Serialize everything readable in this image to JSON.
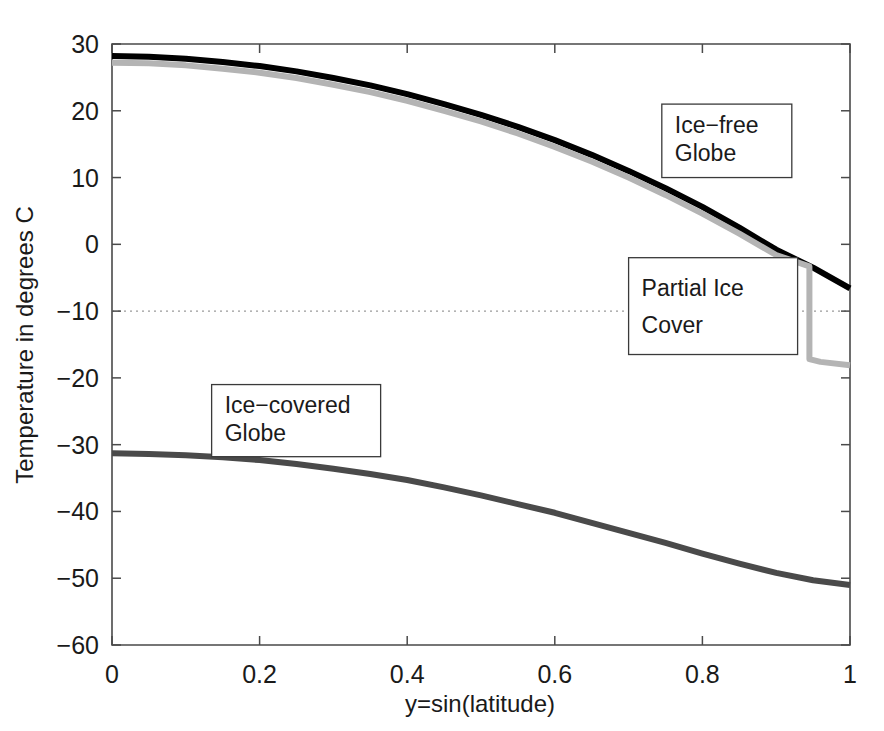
{
  "chart_data": {
    "type": "line",
    "title": "",
    "xlabel": "y=sin(latitude)",
    "ylabel": "Temperature in degrees C",
    "xlim": [
      0,
      1
    ],
    "ylim": [
      -60,
      30
    ],
    "xticks": [
      "0",
      "0.2",
      "0.4",
      "0.6",
      "0.8",
      "1"
    ],
    "xtick_values": [
      0,
      0.2,
      0.4,
      0.6,
      0.8,
      1
    ],
    "yticks": [
      "30",
      "20",
      "10",
      "0",
      "-10",
      "-20",
      "-30",
      "-40",
      "-50",
      "-60"
    ],
    "ytick_values": [
      30,
      20,
      10,
      0,
      -10,
      -20,
      -30,
      -40,
      -50,
      -60
    ],
    "grid": false,
    "legend_position": "none",
    "reference_lines": [
      {
        "name": "critical-temperature",
        "axis": "y",
        "value": -10,
        "style": "dotted",
        "color": "#9a9a9a"
      }
    ],
    "series": [
      {
        "name": "Ice-free Globe",
        "color": "#000000",
        "linewidth": 6,
        "x": [
          0,
          0.05,
          0.1,
          0.15,
          0.2,
          0.25,
          0.3,
          0.35,
          0.4,
          0.45,
          0.5,
          0.55,
          0.6,
          0.65,
          0.7,
          0.75,
          0.8,
          0.85,
          0.9,
          0.95,
          1.0
        ],
        "y": [
          28.2,
          28.1,
          27.8,
          27.3,
          26.7,
          25.9,
          24.9,
          23.8,
          22.5,
          21.0,
          19.4,
          17.6,
          15.6,
          13.4,
          11.0,
          8.4,
          5.6,
          2.5,
          -0.8,
          -3.5,
          -6.6
        ]
      },
      {
        "name": "Partial Ice Cover",
        "color": "#b4b4b4",
        "linewidth": 6,
        "x": [
          0,
          0.05,
          0.1,
          0.15,
          0.2,
          0.25,
          0.3,
          0.35,
          0.4,
          0.45,
          0.5,
          0.55,
          0.6,
          0.65,
          0.7,
          0.75,
          0.8,
          0.85,
          0.9,
          0.945,
          0.945,
          0.96,
          1.0
        ],
        "y": [
          27.2,
          27.1,
          26.8,
          26.3,
          25.7,
          24.9,
          23.9,
          22.8,
          21.5,
          20.0,
          18.4,
          16.6,
          14.6,
          12.4,
          10.0,
          7.4,
          4.6,
          1.6,
          -1.6,
          -3.3,
          -17.2,
          -17.6,
          -18.1
        ],
        "discontinuity_at_x": 0.945,
        "discontinuity_from_y": -3.3,
        "discontinuity_to_y": -17.2
      },
      {
        "name": "Ice-covered Globe",
        "color": "#4a4a4a",
        "linewidth": 6,
        "x": [
          0,
          0.05,
          0.1,
          0.15,
          0.2,
          0.25,
          0.3,
          0.35,
          0.4,
          0.45,
          0.5,
          0.55,
          0.6,
          0.65,
          0.7,
          0.75,
          0.8,
          0.85,
          0.9,
          0.95,
          1.0
        ],
        "y": [
          -31.3,
          -31.4,
          -31.6,
          -31.9,
          -32.3,
          -32.9,
          -33.6,
          -34.4,
          -35.3,
          -36.4,
          -37.6,
          -38.9,
          -40.2,
          -41.7,
          -43.2,
          -44.7,
          -46.3,
          -47.8,
          -49.2,
          -50.3,
          -51.0
        ]
      }
    ],
    "annotations": [
      {
        "name": "ice-free-globe",
        "line1": "Ice-free",
        "line2": "Globe",
        "box_x": 0.745,
        "box_y_top": 21.0,
        "box_y_bottom": 10.0
      },
      {
        "name": "partial-ice-cover",
        "line1": "Partial Ice",
        "line2": "Cover",
        "box_x": 0.7,
        "box_y_top": -2.0,
        "box_y_bottom": -16.5
      },
      {
        "name": "ice-covered-globe",
        "line1": "Ice-covered",
        "line2": "Globe",
        "box_x": 0.135,
        "box_y_top": -21.0,
        "box_y_bottom": -31.8
      }
    ]
  },
  "figure": {
    "background_color": "#ffffff",
    "axis_color": "#4a4a4a"
  }
}
